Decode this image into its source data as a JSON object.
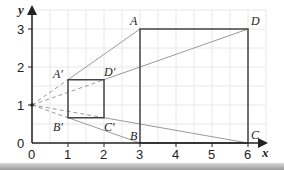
{
  "diagram": {
    "type": "enlargement-grid",
    "axes": {
      "x_label": "x",
      "y_label": "y",
      "x_ticks": [
        "0",
        "1",
        "2",
        "3",
        "4",
        "5",
        "6"
      ],
      "y_ticks": [
        "0",
        "1",
        "2",
        "3"
      ],
      "x_range": [
        0,
        6.5
      ],
      "y_range": [
        0,
        3.3
      ],
      "grid": true
    },
    "centre": {
      "x": 0,
      "y": 1
    },
    "large_rectangle": {
      "A": {
        "label": "A",
        "x": 3,
        "y": 3
      },
      "B": {
        "label": "B",
        "x": 3,
        "y": 0
      },
      "C": {
        "label": "C",
        "x": 6,
        "y": 0
      },
      "D": {
        "label": "D",
        "x": 6,
        "y": 3
      }
    },
    "small_rectangle": {
      "A1": {
        "label": "A′",
        "x": 1,
        "y": 1.667
      },
      "B1": {
        "label": "B′",
        "x": 1,
        "y": 0.667
      },
      "C1": {
        "label": "C′",
        "x": 2,
        "y": 0.667
      },
      "D1": {
        "label": "D′",
        "x": 2,
        "y": 1.667
      }
    },
    "colors": {
      "grid": "#e6e6e6",
      "axis": "#222222",
      "shape": "#444444",
      "ray": "#9a9a9a"
    }
  }
}
